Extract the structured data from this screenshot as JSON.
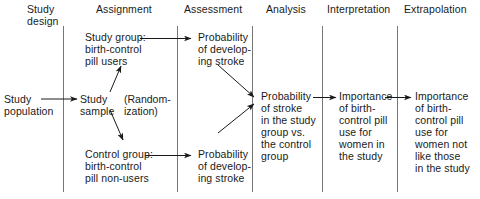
{
  "figure": {
    "columns": [
      {
        "id": "study-design",
        "header": "Study\ndesign"
      },
      {
        "id": "assignment",
        "header": "Assignment"
      },
      {
        "id": "assessment",
        "header": "Assessment"
      },
      {
        "id": "analysis",
        "header": "Analysis"
      },
      {
        "id": "interpretation",
        "header": "Interpretation"
      },
      {
        "id": "extrapolation",
        "header": "Extrapolation"
      }
    ],
    "nodes": [
      {
        "id": "study-population",
        "text": "Study\npopulation"
      },
      {
        "id": "study-sample",
        "text": "Study\nsample"
      },
      {
        "id": "randomization",
        "text": "(Random-\nization)"
      },
      {
        "id": "study-group",
        "text": "Study group:\nbirth-control\npill users"
      },
      {
        "id": "control-group",
        "text": "Control group:\nbirth-control\npill non-users"
      },
      {
        "id": "prob-stroke-study",
        "text": "Probability\nof develop-\ning stroke"
      },
      {
        "id": "prob-stroke-control",
        "text": "Probability\nof develop-\ning stroke"
      },
      {
        "id": "prob-stroke-compare",
        "text": "Probability\nof stroke\nin the study\ngroup vs.\nthe control\ngroup"
      },
      {
        "id": "importance-in-study",
        "text": "Importance\nof birth-\ncontrol pill\nuse for\nwomen in\nthe study"
      },
      {
        "id": "importance-not-in-study",
        "text": "Importance\nof birth-\ncontrol pill\nuse for\nwomen not\nlike those\nin the study"
      }
    ],
    "colors": {
      "ink": "#1a1a1a",
      "rule": "#555555",
      "background": "#ffffff"
    }
  }
}
